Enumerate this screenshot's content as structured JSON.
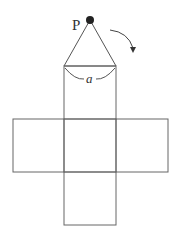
{
  "diagram": {
    "apex_label": "P",
    "angle_label": "a",
    "stroke_color": "#555555",
    "point_color": "#222222"
  }
}
